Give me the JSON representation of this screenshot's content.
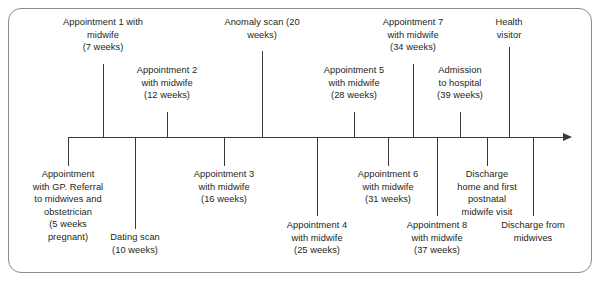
{
  "diagram": {
    "frame_color": "#8a8a92",
    "line_color": "#3a3a3c",
    "text_color": "#231f20",
    "axis": {
      "start_x": 68,
      "end_x": 572,
      "y": 137,
      "arrow": "right-arrow"
    },
    "events_above": [
      {
        "id": "appointment-1",
        "text": "Appointment 1 with\nmidwife\n(7 weeks)",
        "name": "Appointment 1 with midwife",
        "weeks": "7 weeks",
        "x": 103,
        "label_top": 16,
        "stem_top": 64
      },
      {
        "id": "appointment-2",
        "text": "Appointment 2\nwith midwife\n(12 weeks)",
        "name": "Appointment 2 with midwife",
        "weeks": "12 weeks",
        "x": 167,
        "label_top": 64,
        "stem_top": 112
      },
      {
        "id": "anomaly-scan",
        "text": "Anomaly scan (20\nweeks)",
        "name": "Anomaly scan",
        "weeks": "20 weeks",
        "x": 262,
        "label_top": 16,
        "stem_top": 51
      },
      {
        "id": "appointment-5",
        "text": "Appointment 5\nwith midwife\n(28 weeks)",
        "name": "Appointment 5 with midwife",
        "weeks": "28 weeks",
        "x": 354,
        "label_top": 64,
        "stem_top": 112
      },
      {
        "id": "appointment-7",
        "text": "Appointment 7\nwith midwife\n(34 weeks)",
        "name": "Appointment 7 with midwife",
        "weeks": "34 weeks",
        "x": 413,
        "label_top": 16,
        "stem_top": 64
      },
      {
        "id": "admission-to-hospital",
        "text": "Admission\nto hospital\n(39 weeks)",
        "name": "Admission to hospital",
        "weeks": "39 weeks",
        "x": 460,
        "label_top": 64,
        "stem_top": 112
      },
      {
        "id": "health-visitor",
        "text": "Health\nvisitor",
        "name": "Health visitor",
        "weeks": "",
        "x": 509,
        "label_top": 16,
        "stem_top": 47
      }
    ],
    "events_below": [
      {
        "id": "appointment-gp",
        "text": "Appointment\nwith GP. Referral\nto midwives and\nobstetrician\n(5 weeks\npregnant)",
        "name": "Appointment with GP. Referral to midwives and obstetrician",
        "weeks": "5 weeks pregnant",
        "x": 68,
        "stem_bottom": 166,
        "label_top": 168
      },
      {
        "id": "dating-scan",
        "text": "Dating scan\n(10 weeks)",
        "name": "Dating scan",
        "weeks": "10 weeks",
        "x": 135,
        "stem_bottom": 229,
        "label_top": 231
      },
      {
        "id": "appointment-3",
        "text": "Appointment 3\nwith midwife\n(16 weeks)",
        "name": "Appointment 3 with midwife",
        "weeks": "16 weeks",
        "x": 224,
        "stem_bottom": 166,
        "label_top": 168
      },
      {
        "id": "appointment-4",
        "text": "Appointment 4\nwith midwife\n(25 weeks)",
        "name": "Appointment 4 with midwife",
        "weeks": "25 weeks",
        "x": 317,
        "stem_bottom": 216,
        "label_top": 219
      },
      {
        "id": "appointment-6",
        "text": "Appointment 6\nwith midwife\n(31 weeks)",
        "name": "Appointment 6 with midwife",
        "weeks": "31 weeks",
        "x": 388,
        "stem_bottom": 166,
        "label_top": 168
      },
      {
        "id": "appointment-8",
        "text": "Appointment 8\nwith midwife\n(37 weeks)",
        "name": "Appointment 8 with midwife",
        "weeks": "37 weeks",
        "x": 437,
        "stem_bottom": 216,
        "label_top": 219
      },
      {
        "id": "discharge-home",
        "text": "Discharge\nhome and first\npostnatal\nmidwife visit",
        "name": "Discharge home and first postnatal midwife visit",
        "weeks": "",
        "x": 487,
        "stem_bottom": 166,
        "label_top": 168
      },
      {
        "id": "discharge-from-midwives",
        "text": "Discharge from\nmidwives",
        "name": "Discharge from midwives",
        "weeks": "",
        "x": 533,
        "stem_bottom": 216,
        "label_top": 219
      }
    ]
  }
}
